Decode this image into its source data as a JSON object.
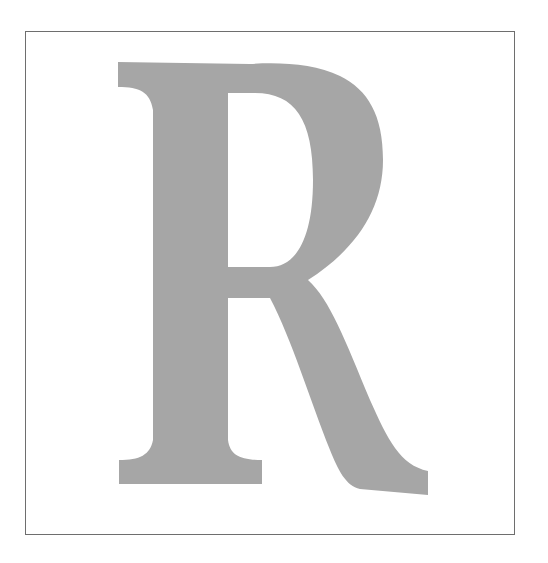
{
  "figure": {
    "letter": "R",
    "colors": {
      "background": "#ffffff",
      "frame": "#6e6e6e",
      "glyph_fill": "#a6a6a6"
    }
  }
}
